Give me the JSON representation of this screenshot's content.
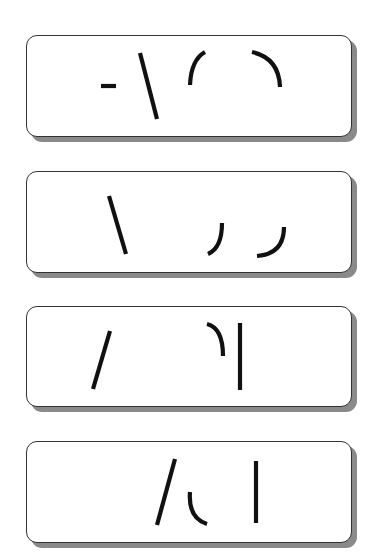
{
  "puzzle": {
    "type": "stroke-fragment-panels",
    "panel_count": 4,
    "colors": {
      "background": "#ffffff",
      "panel_fill": "#ffffff",
      "panel_border": "#333333",
      "panel_shadow": "#8a8a8a",
      "stroke": "#111111"
    },
    "panels": [
      {
        "index": 1,
        "box": {
          "x": 26,
          "y": 35,
          "w": 326,
          "h": 102
        },
        "strokes": [
          {
            "kind": "dash",
            "d": "M101 86 L116 86"
          },
          {
            "kind": "backslash",
            "d": "M140 53 L157 119"
          },
          {
            "kind": "arc-left",
            "d": "M205 52 Q191 60 190 85"
          },
          {
            "kind": "arc-right",
            "d": "M252 52 Q279 58 280 87"
          }
        ]
      },
      {
        "index": 2,
        "box": {
          "x": 26,
          "y": 171,
          "w": 326,
          "h": 102
        },
        "strokes": [
          {
            "kind": "backslash",
            "d": "M109 196 L126 254"
          },
          {
            "kind": "hook",
            "d": "M222 223 Q222 248 208 254"
          },
          {
            "kind": "hook",
            "d": "M284 227 Q284 254 257 256"
          }
        ]
      },
      {
        "index": 3,
        "box": {
          "x": 26,
          "y": 306,
          "w": 326,
          "h": 101
        },
        "strokes": [
          {
            "kind": "slash",
            "d": "M110 331 L93 389"
          },
          {
            "kind": "hook",
            "d": "M207 324 Q223 328 223 356"
          },
          {
            "kind": "vertical",
            "d": "M240 323 L240 390"
          }
        ]
      },
      {
        "index": 4,
        "box": {
          "x": 26,
          "y": 441,
          "w": 326,
          "h": 102
        },
        "strokes": [
          {
            "kind": "slash",
            "d": "M175 459 L157 525"
          },
          {
            "kind": "hook",
            "d": "M190 492 Q188 518 207 524"
          },
          {
            "kind": "vertical",
            "d": "M256 461 L256 523"
          }
        ]
      }
    ]
  }
}
